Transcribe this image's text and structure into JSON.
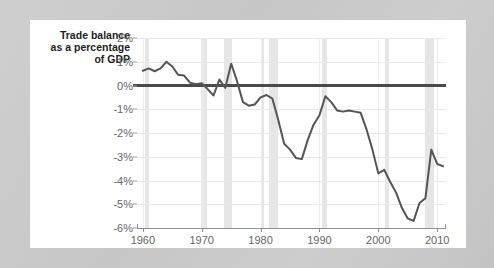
{
  "figure": {
    "background_color": "#ffffff",
    "outer_background_color": "#c9c9c9"
  },
  "axis_title": {
    "line1": "Trade balance",
    "line2": "as a percentage",
    "line3": "of GDP"
  },
  "chart_data": {
    "type": "line",
    "title": "Trade balance as a percentage of GDP",
    "xlabel": "",
    "ylabel": "Trade balance as a percentage of GDP",
    "xlim": [
      1959,
      2011.5
    ],
    "ylim": [
      -6,
      2
    ],
    "grid": true,
    "legend": "none",
    "line_color": "#555555",
    "zero_line_color": "#4a4a4a",
    "recession_band_color": "#e6e6e6",
    "ytick_labels": [
      "2%",
      "1%",
      "0%",
      "-1%",
      "-2%",
      "-3%",
      "-4%",
      "-5%",
      "-6%"
    ],
    "ytick_values": [
      2,
      1,
      0,
      -1,
      -2,
      -3,
      -4,
      -5,
      -6
    ],
    "xtick_labels": [
      "1960",
      "1970",
      "1980",
      "1990",
      "2000",
      "2010"
    ],
    "xtick_values": [
      1960,
      1970,
      1980,
      1990,
      2000,
      2010
    ],
    "x": [
      1960,
      1961,
      1962,
      1963,
      1964,
      1965,
      1966,
      1967,
      1968,
      1969,
      1970,
      1971,
      1972,
      1973,
      1974,
      1975,
      1976,
      1977,
      1978,
      1979,
      1980,
      1981,
      1982,
      1983,
      1984,
      1985,
      1986,
      1987,
      1988,
      1989,
      1990,
      1991,
      1992,
      1993,
      1994,
      1995,
      1996,
      1997,
      1998,
      1999,
      2000,
      2001,
      2002,
      2003,
      2004,
      2005,
      2006,
      2007,
      2008,
      2009,
      2010,
      2011
    ],
    "values": [
      0.62,
      0.72,
      0.6,
      0.72,
      1.0,
      0.8,
      0.45,
      0.42,
      0.12,
      0.05,
      0.1,
      -0.15,
      -0.42,
      0.25,
      -0.1,
      0.92,
      0.18,
      -0.7,
      -0.85,
      -0.8,
      -0.5,
      -0.4,
      -0.55,
      -1.45,
      -2.45,
      -2.7,
      -3.05,
      -3.1,
      -2.3,
      -1.65,
      -1.25,
      -0.45,
      -0.7,
      -1.05,
      -1.1,
      -1.05,
      -1.1,
      -1.15,
      -1.85,
      -2.7,
      -3.7,
      -3.55,
      -4.05,
      -4.5,
      -5.15,
      -5.6,
      -5.7,
      -4.95,
      -4.75,
      -2.7,
      -3.3,
      -3.4
    ],
    "recessions": [
      {
        "start": 1960.3,
        "end": 1961.1
      },
      {
        "start": 1969.9,
        "end": 1970.9
      },
      {
        "start": 1973.8,
        "end": 1975.2
      },
      {
        "start": 1980.0,
        "end": 1980.5
      },
      {
        "start": 1981.5,
        "end": 1982.9
      },
      {
        "start": 1990.5,
        "end": 1991.2
      },
      {
        "start": 2001.2,
        "end": 2001.9
      },
      {
        "start": 2007.9,
        "end": 2009.4
      }
    ]
  }
}
